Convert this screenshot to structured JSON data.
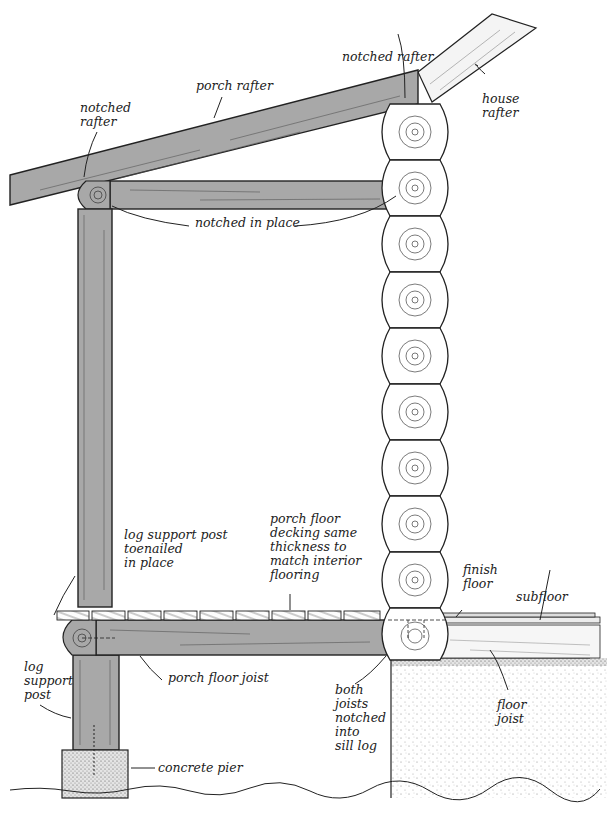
{
  "diagram": {
    "colors": {
      "timber_fill": "#a8a8a8",
      "timber_stroke": "#222222",
      "log_wall_fill": "#ffffff",
      "house_rafter_fill": "#f4f4f4",
      "concrete_fill": "#eeeeee",
      "background": "#ffffff",
      "label_text": "#222222"
    },
    "labels": {
      "porch_rafter": "porch rafter",
      "notched_rafter_left": "notched\nrafter",
      "notched_rafter_top": "notched rafter",
      "house_rafter": "house\nrafter",
      "notched_in_place": "notched in place",
      "log_support_post_toenailed": "log support post\ntoenailed\nin place",
      "porch_floor_decking": "porch floor\ndecking same\nthickness to\nmatch interior\nflooring",
      "finish_floor": "finish\nfloor",
      "subfloor": "subfloor",
      "porch_floor_joist": "porch floor joist",
      "log_support_post": "log\nsupport\npost",
      "both_joists_notched": "both\njoists\nnotched\ninto\nsill log",
      "floor_joist": "floor\njoist",
      "concrete_pier": "concrete pier"
    },
    "components": [
      "porch rafter",
      "house rafter",
      "porch beam",
      "log support post",
      "log wall (10 stacked logs)",
      "porch floor decking (9 boards)",
      "porch floor joist",
      "interior finish floor",
      "subfloor",
      "interior floor joist",
      "sill log",
      "concrete pier",
      "foundation",
      "ground line"
    ],
    "wall_log_count": 10,
    "deck_board_count": 9
  }
}
